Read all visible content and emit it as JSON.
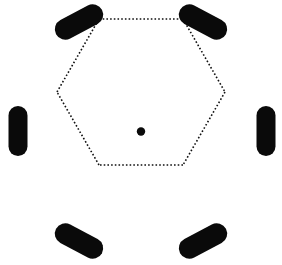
{
  "figure": {
    "canvas": {
      "width": 282,
      "height": 265,
      "background": "#ffffff"
    },
    "colors": {
      "element_fill": "#0a0a0a",
      "connector_stroke": "#111111",
      "center_dot_fill": "#0a0a0a",
      "background": "#ffffff"
    },
    "center_marker": {
      "label": "center point",
      "cx": 141,
      "cy": 131.5,
      "radius": 4.2
    },
    "connectors": {
      "label": "hexagon dotted outline",
      "style": "dotted",
      "stroke_width": 1.6,
      "dash_pattern": "1.6 2.1",
      "vertices": [
        {
          "x": 99,
          "y": 19
        },
        {
          "x": 183,
          "y": 19
        },
        {
          "x": 225,
          "y": 92
        },
        {
          "x": 183,
          "y": 165
        },
        {
          "x": 99,
          "y": 165
        },
        {
          "x": 57,
          "y": 92
        }
      ]
    },
    "elements": [
      {
        "id": "capsule-top-left",
        "label": "top left capsule",
        "cx": 79,
        "cy": 22,
        "length": 52,
        "thickness": 21,
        "angle_deg": -28
      },
      {
        "id": "capsule-top-right",
        "label": "top right capsule",
        "cx": 203,
        "cy": 22,
        "length": 52,
        "thickness": 21,
        "angle_deg": 28
      },
      {
        "id": "capsule-right",
        "label": "right capsule",
        "cx": 266,
        "cy": 131,
        "length": 50,
        "thickness": 19,
        "angle_deg": 90
      },
      {
        "id": "capsule-bottom-right",
        "label": "bottom right capsule",
        "cx": 203,
        "cy": 241,
        "length": 52,
        "thickness": 21,
        "angle_deg": -28
      },
      {
        "id": "capsule-bottom-left",
        "label": "bottom left capsule",
        "cx": 79,
        "cy": 241,
        "length": 52,
        "thickness": 21,
        "angle_deg": 28
      },
      {
        "id": "capsule-left",
        "label": "left capsule",
        "cx": 18,
        "cy": 131,
        "length": 50,
        "thickness": 19,
        "angle_deg": 90
      }
    ]
  }
}
